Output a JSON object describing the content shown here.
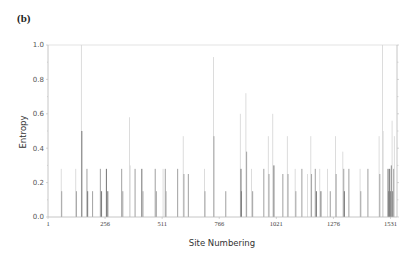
{
  "panel_label": "(b)",
  "chart_data": {
    "type": "bar",
    "title": "",
    "xlabel": "Site Numbering",
    "ylabel": "Entropy",
    "xlim": [
      1,
      1560
    ],
    "ylim": [
      0,
      1.0
    ],
    "x_ticks": [
      1,
      256,
      511,
      766,
      1021,
      1276,
      1531
    ],
    "y_ticks": [
      "0.0",
      "0.2",
      "0.4",
      "0.6",
      "0.8",
      "1.0"
    ],
    "grid": false,
    "legend": null,
    "bars": [
      {
        "site": 60,
        "entropy": 0.28,
        "shade": "light"
      },
      {
        "site": 62,
        "entropy": 0.15,
        "shade": "mid"
      },
      {
        "site": 125,
        "entropy": 0.28,
        "shade": "light"
      },
      {
        "site": 128,
        "entropy": 0.15,
        "shade": "mid"
      },
      {
        "site": 150,
        "entropy": 1.0,
        "shade": "light"
      },
      {
        "site": 152,
        "entropy": 0.5,
        "shade": "dark"
      },
      {
        "site": 175,
        "entropy": 0.28,
        "shade": "mid"
      },
      {
        "site": 178,
        "entropy": 0.15,
        "shade": "dark"
      },
      {
        "site": 200,
        "entropy": 0.15,
        "shade": "mid"
      },
      {
        "site": 235,
        "entropy": 0.28,
        "shade": "mid"
      },
      {
        "site": 240,
        "entropy": 0.15,
        "shade": "dark"
      },
      {
        "site": 262,
        "entropy": 0.28,
        "shade": "dark"
      },
      {
        "site": 268,
        "entropy": 0.15,
        "shade": "dark"
      },
      {
        "site": 330,
        "entropy": 0.28,
        "shade": "mid"
      },
      {
        "site": 335,
        "entropy": 0.15,
        "shade": "mid"
      },
      {
        "site": 365,
        "entropy": 0.58,
        "shade": "light"
      },
      {
        "site": 368,
        "entropy": 0.3,
        "shade": "light"
      },
      {
        "site": 390,
        "entropy": 0.28,
        "shade": "mid"
      },
      {
        "site": 420,
        "entropy": 0.28,
        "shade": "dark"
      },
      {
        "site": 425,
        "entropy": 0.15,
        "shade": "mid"
      },
      {
        "site": 480,
        "entropy": 0.28,
        "shade": "mid"
      },
      {
        "site": 485,
        "entropy": 0.15,
        "shade": "mid"
      },
      {
        "site": 515,
        "entropy": 0.28,
        "shade": "light"
      },
      {
        "site": 525,
        "entropy": 0.28,
        "shade": "mid"
      },
      {
        "site": 528,
        "entropy": 0.15,
        "shade": "mid"
      },
      {
        "site": 580,
        "entropy": 0.28,
        "shade": "mid"
      },
      {
        "site": 605,
        "entropy": 0.47,
        "shade": "light"
      },
      {
        "site": 608,
        "entropy": 0.25,
        "shade": "mid"
      },
      {
        "site": 628,
        "entropy": 0.25,
        "shade": "mid"
      },
      {
        "site": 700,
        "entropy": 0.28,
        "shade": "light"
      },
      {
        "site": 702,
        "entropy": 0.15,
        "shade": "mid"
      },
      {
        "site": 740,
        "entropy": 0.93,
        "shade": "light"
      },
      {
        "site": 742,
        "entropy": 0.47,
        "shade": "mid"
      },
      {
        "site": 795,
        "entropy": 0.15,
        "shade": "mid"
      },
      {
        "site": 860,
        "entropy": 0.6,
        "shade": "light"
      },
      {
        "site": 863,
        "entropy": 0.28,
        "shade": "dark"
      },
      {
        "site": 865,
        "entropy": 0.15,
        "shade": "dark"
      },
      {
        "site": 885,
        "entropy": 0.72,
        "shade": "light"
      },
      {
        "site": 888,
        "entropy": 0.38,
        "shade": "mid"
      },
      {
        "site": 910,
        "entropy": 0.28,
        "shade": "light"
      },
      {
        "site": 915,
        "entropy": 0.15,
        "shade": "mid"
      },
      {
        "site": 965,
        "entropy": 0.28,
        "shade": "mid"
      },
      {
        "site": 985,
        "entropy": 0.47,
        "shade": "light"
      },
      {
        "site": 988,
        "entropy": 0.25,
        "shade": "mid"
      },
      {
        "site": 1005,
        "entropy": 0.6,
        "shade": "light"
      },
      {
        "site": 1010,
        "entropy": 0.3,
        "shade": "dark"
      },
      {
        "site": 1050,
        "entropy": 0.25,
        "shade": "mid"
      },
      {
        "site": 1070,
        "entropy": 0.47,
        "shade": "light"
      },
      {
        "site": 1073,
        "entropy": 0.25,
        "shade": "mid"
      },
      {
        "site": 1105,
        "entropy": 0.28,
        "shade": "light"
      },
      {
        "site": 1108,
        "entropy": 0.15,
        "shade": "mid"
      },
      {
        "site": 1135,
        "entropy": 0.28,
        "shade": "mid"
      },
      {
        "site": 1160,
        "entropy": 0.25,
        "shade": "light"
      },
      {
        "site": 1175,
        "entropy": 0.47,
        "shade": "light"
      },
      {
        "site": 1178,
        "entropy": 0.25,
        "shade": "mid"
      },
      {
        "site": 1195,
        "entropy": 0.28,
        "shade": "mid"
      },
      {
        "site": 1200,
        "entropy": 0.15,
        "shade": "dark"
      },
      {
        "site": 1215,
        "entropy": 0.28,
        "shade": "light"
      },
      {
        "site": 1220,
        "entropy": 0.15,
        "shade": "dark"
      },
      {
        "site": 1250,
        "entropy": 0.28,
        "shade": "light"
      },
      {
        "site": 1262,
        "entropy": 0.15,
        "shade": "mid"
      },
      {
        "site": 1285,
        "entropy": 0.47,
        "shade": "light"
      },
      {
        "site": 1288,
        "entropy": 0.25,
        "shade": "mid"
      },
      {
        "site": 1318,
        "entropy": 0.38,
        "shade": "light"
      },
      {
        "site": 1322,
        "entropy": 0.28,
        "shade": "mid"
      },
      {
        "site": 1325,
        "entropy": 0.15,
        "shade": "dark"
      },
      {
        "site": 1345,
        "entropy": 0.28,
        "shade": "mid"
      },
      {
        "site": 1395,
        "entropy": 0.28,
        "shade": "light"
      },
      {
        "site": 1398,
        "entropy": 0.15,
        "shade": "mid"
      },
      {
        "site": 1430,
        "entropy": 0.28,
        "shade": "mid"
      },
      {
        "site": 1480,
        "entropy": 0.47,
        "shade": "light"
      },
      {
        "site": 1483,
        "entropy": 0.25,
        "shade": "mid"
      },
      {
        "site": 1495,
        "entropy": 1.0,
        "shade": "light"
      },
      {
        "site": 1498,
        "entropy": 0.5,
        "shade": "light"
      },
      {
        "site": 1520,
        "entropy": 0.28,
        "shade": "dark"
      },
      {
        "site": 1523,
        "entropy": 0.15,
        "shade": "dark"
      },
      {
        "site": 1527,
        "entropy": 0.28,
        "shade": "dark"
      },
      {
        "site": 1530,
        "entropy": 0.15,
        "shade": "dark"
      },
      {
        "site": 1535,
        "entropy": 0.3,
        "shade": "dark"
      },
      {
        "site": 1538,
        "entropy": 0.56,
        "shade": "light"
      },
      {
        "site": 1541,
        "entropy": 0.15,
        "shade": "dark"
      },
      {
        "site": 1545,
        "entropy": 0.28,
        "shade": "mid"
      },
      {
        "site": 1548,
        "entropy": 0.47,
        "shade": "light"
      }
    ]
  },
  "colors": {
    "light": "#d4d4d4",
    "mid": "#a9a9a9",
    "dark": "#7f7f7f",
    "axis": "#b8b8b8",
    "frame": "#dcdcdc"
  }
}
